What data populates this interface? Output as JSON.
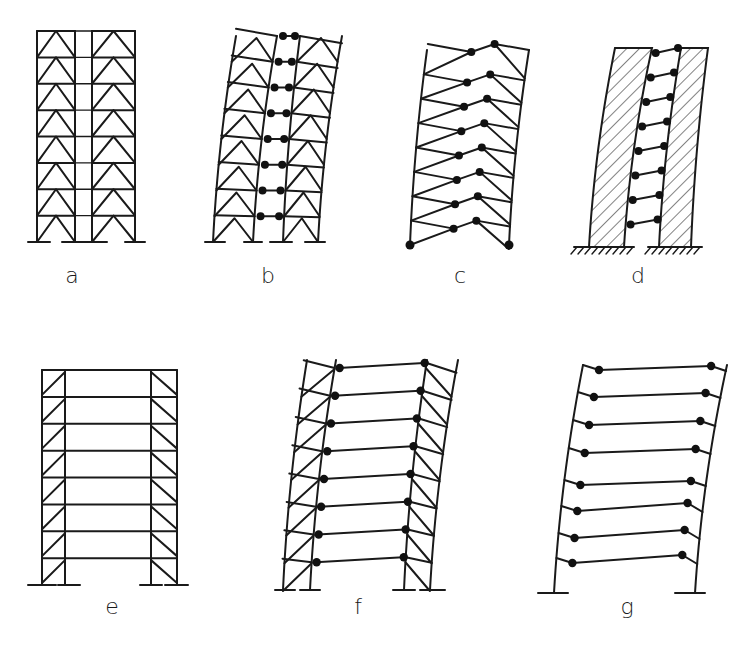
{
  "figure": {
    "stroke_color": "#1a1a1a",
    "hinge_color": "#111111",
    "background": "#ffffff"
  },
  "panels": [
    {
      "id": "a",
      "label": "a",
      "label_pos": [
        72,
        276
      ],
      "type": "braced-core-frame-undeformed"
    },
    {
      "id": "b",
      "label": "b",
      "label_pos": [
        268,
        276
      ],
      "type": "braced-frame-coupled-deformed-with-hinges"
    },
    {
      "id": "c",
      "label": "c",
      "label_pos": [
        460,
        276
      ],
      "type": "k-braced-frame-deformed-with-hinges"
    },
    {
      "id": "d",
      "label": "d",
      "label_pos": [
        638,
        276
      ],
      "type": "coupled-shear-walls-deformed"
    },
    {
      "id": "e",
      "label": "e",
      "label_pos": [
        112,
        608
      ],
      "type": "braced-bays-rigid-frame-undeformed"
    },
    {
      "id": "f",
      "label": "f",
      "label_pos": [
        358,
        608
      ],
      "type": "braced-bays-frame-deformed-with-hinges"
    },
    {
      "id": "g",
      "label": "g",
      "label_pos": [
        627,
        608
      ],
      "type": "moment-frame-deformed-with-hinges"
    }
  ],
  "geometry": {
    "a": {
      "cols": [
        37,
        75,
        92,
        135
      ],
      "top": 31,
      "base": 242,
      "storeys": 8,
      "footings": [
        [
          28,
          50
        ],
        [
          62,
          88
        ],
        [
          88,
          107
        ],
        [
          125,
          145
        ]
      ]
    },
    "b": {
      "top": 36,
      "base": 242,
      "storeys": 8,
      "cols_base": [
        213,
        253,
        283,
        318
      ],
      "cols_top": [
        236,
        277,
        300,
        342
      ],
      "footings": [
        [
          205,
          225
        ],
        [
          244,
          262
        ],
        [
          270,
          292
        ],
        [
          305,
          325
        ]
      ]
    },
    "c": {
      "top": 50,
      "base": 245,
      "storeys": 8,
      "col_left_base": 410,
      "col_left_top": 427,
      "col_right_base": 509,
      "col_right_top": 529
    },
    "d": {
      "top": 48,
      "base": 247,
      "walls": [
        {
          "base_l": 589,
          "base_r": 624,
          "top_l": 615,
          "top_r": 652
        },
        {
          "base_l": 659,
          "base_r": 691,
          "top_l": 681,
          "top_r": 708
        }
      ],
      "ground": [
        [
          574,
          634
        ],
        [
          648,
          702
        ]
      ]
    },
    "e": {
      "cols": [
        42,
        65,
        151,
        177
      ],
      "top": 370,
      "base": 585,
      "storeys": 8,
      "footings": [
        [
          28,
          56
        ],
        [
          58,
          80
        ],
        [
          140,
          162
        ],
        [
          165,
          188
        ]
      ]
    },
    "f": {
      "top": 360,
      "base": 590,
      "storeys": 8,
      "cols_base": [
        283,
        310,
        404,
        430
      ],
      "cols_top": [
        307,
        336,
        427,
        458
      ],
      "footings": [
        [
          275,
          295
        ],
        [
          300,
          320
        ],
        [
          393,
          415
        ],
        [
          420,
          445
        ]
      ]
    },
    "g": {
      "top": 365,
      "base": 593,
      "storeys": 8,
      "col_left_base": 554,
      "col_left_top": 583,
      "col_right_base": 695,
      "col_right_top": 727,
      "footings": [
        [
          538,
          568
        ],
        [
          675,
          705
        ]
      ]
    }
  }
}
